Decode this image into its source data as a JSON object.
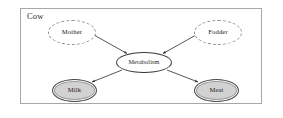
{
  "diagram": {
    "container_label": "Cow",
    "type": "influence-diagram",
    "nodes": [
      {
        "id": "mother",
        "label": "Mother",
        "style": "dashed-ellipse",
        "fill": "#ffffff",
        "stroke": "#8f8f8f",
        "role": "input"
      },
      {
        "id": "fodder",
        "label": "Fodder",
        "style": "dashed-ellipse",
        "fill": "#ffffff",
        "stroke": "#8f8f8f",
        "role": "input"
      },
      {
        "id": "metabolism",
        "label": "Metabolism",
        "style": "solid-ellipse",
        "fill": "#ffffff",
        "stroke": "#3a3a3a",
        "role": "process"
      },
      {
        "id": "milk",
        "label": "Milk",
        "style": "filled-ellipse",
        "fill": "#d2d2d2",
        "stroke": "#4a4a4a",
        "role": "output"
      },
      {
        "id": "meat",
        "label": "Meat",
        "style": "filled-ellipse",
        "fill": "#d2d2d2",
        "stroke": "#4a4a4a",
        "role": "output"
      }
    ],
    "edges": [
      {
        "from": "mother",
        "to": "metabolism",
        "arrow": "filled"
      },
      {
        "from": "fodder",
        "to": "metabolism",
        "arrow": "filled"
      },
      {
        "from": "metabolism",
        "to": "milk",
        "arrow": "filled"
      },
      {
        "from": "metabolism",
        "to": "meat",
        "arrow": "filled"
      }
    ],
    "frame": {
      "stroke": "#a8a8a8",
      "fill": "#ffffff"
    }
  }
}
